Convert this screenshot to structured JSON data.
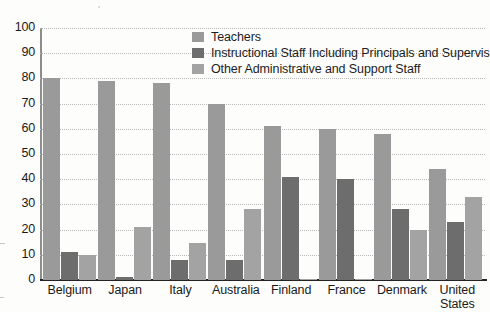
{
  "chart_data": {
    "type": "bar",
    "title": "",
    "xlabel": "",
    "ylabel": "",
    "ylim": [
      0,
      100
    ],
    "yticks": [
      0,
      10,
      20,
      30,
      40,
      50,
      60,
      70,
      80,
      90,
      100
    ],
    "grid": true,
    "legend_position": "top-center",
    "categories": [
      "Belgium",
      "Japan",
      "Italy",
      "Australia",
      "Finland",
      "France",
      "Denmark",
      "United States"
    ],
    "series": [
      {
        "name": "Teachers",
        "color": "#9a9a9a",
        "values": [
          80,
          79,
          78,
          70,
          61,
          60,
          58,
          44
        ]
      },
      {
        "name": "Instructional Staff Including Principals and Supervisors",
        "color": "#6d6d6d",
        "values": [
          11,
          1,
          8,
          8,
          41,
          40,
          28,
          23
        ]
      },
      {
        "name": "Other Administrative and Support Staff",
        "color": "#a3a3a3",
        "values": [
          10,
          21,
          14.5,
          28,
          0.5,
          0.5,
          20,
          33
        ]
      }
    ]
  },
  "axis": {
    "y_tick_labels": [
      "100",
      "90",
      "80",
      "70",
      "60",
      "50",
      "40",
      "30",
      "20",
      "10",
      "0"
    ]
  },
  "x_labels": [
    "Belgium",
    "Japan",
    "Italy",
    "Australia",
    "Finland",
    "France",
    "Denmark",
    "United\nStates"
  ],
  "legend": {
    "items": [
      {
        "label": "Teachers",
        "swatch": "s0"
      },
      {
        "label": "Instructional Staff Including Principals and Supervisors",
        "swatch": "s1"
      },
      {
        "label": "Other Administrative and Support Staff",
        "swatch": "s2"
      }
    ]
  }
}
